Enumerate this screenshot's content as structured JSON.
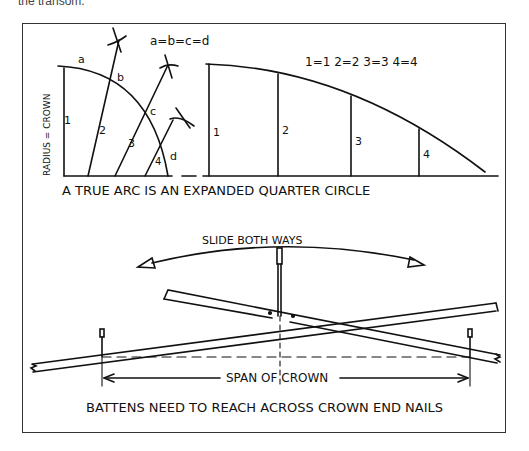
{
  "top_text": "the transom.",
  "top_diagram": {
    "equation_letters": "a=b=c=d",
    "equation_numbers": "1=1   2=2   3=3   4=4",
    "quarter_circle": {
      "vertical_label": "RADIUS = CROWN",
      "arc_labels": [
        "a",
        "b",
        "c",
        "d"
      ],
      "segment_labels": [
        "1",
        "2",
        "3",
        "4"
      ]
    },
    "expanded_arc": {
      "segment_labels": [
        "1",
        "2",
        "3",
        "4"
      ]
    },
    "caption": "A TRUE ARC IS AN EXPANDED QUARTER CIRCLE"
  },
  "bottom_diagram": {
    "arrow_label": "SLIDE BOTH WAYS",
    "span_label": "SPAN OF CROWN",
    "caption": "BATTENS NEED TO REACH ACROSS CROWN END NAILS"
  },
  "colors": {
    "ink": "#111111",
    "frame": "#333333",
    "background": "#ffffff"
  }
}
